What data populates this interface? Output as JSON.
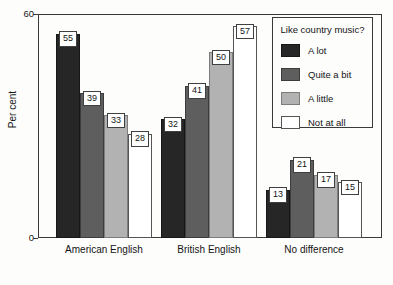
{
  "chart_data": {
    "type": "bar",
    "title": "",
    "xlabel": "",
    "ylabel": "Per cent",
    "ylim": [
      0,
      60
    ],
    "yticks": [
      "0",
      "60"
    ],
    "grid": false,
    "legend_position": "top-right",
    "legend_title": "Like country music?",
    "categories": [
      "American English",
      "British English",
      "No difference"
    ],
    "series": [
      {
        "name": "A lot",
        "color": "#262626",
        "values": [
          55,
          32,
          13
        ]
      },
      {
        "name": "Quite a bit",
        "color": "#5e5e5e",
        "values": [
          39,
          41,
          21
        ]
      },
      {
        "name": "A little",
        "color": "#b2b2b2",
        "values": [
          33,
          50,
          17
        ]
      },
      {
        "name": "Not at all",
        "color": "#ffffff",
        "values": [
          28,
          57,
          15
        ]
      }
    ]
  },
  "axis": {
    "y_label": "Per cent",
    "y_max_label": "60",
    "y_min_label": "0"
  },
  "legend": {
    "title": "Like country music?",
    "items": [
      {
        "label": "A lot"
      },
      {
        "label": "Quite a bit"
      },
      {
        "label": "A little"
      },
      {
        "label": "Not at all"
      }
    ]
  },
  "groups": [
    {
      "label": "American English",
      "bars": [
        {
          "value": "55",
          "series": "A lot"
        },
        {
          "value": "39",
          "series": "Quite a bit"
        },
        {
          "value": "33",
          "series": "A little"
        },
        {
          "value": "28",
          "series": "Not at all"
        }
      ]
    },
    {
      "label": "British English",
      "bars": [
        {
          "value": "32",
          "series": "A lot"
        },
        {
          "value": "41",
          "series": "Quite a bit"
        },
        {
          "value": "50",
          "series": "A little"
        },
        {
          "value": "57",
          "series": "Not at all"
        }
      ]
    },
    {
      "label": "No difference",
      "bars": [
        {
          "value": "13",
          "series": "A lot"
        },
        {
          "value": "21",
          "series": "Quite a bit"
        },
        {
          "value": "17",
          "series": "A little"
        },
        {
          "value": "15",
          "series": "Not at all"
        }
      ]
    }
  ]
}
